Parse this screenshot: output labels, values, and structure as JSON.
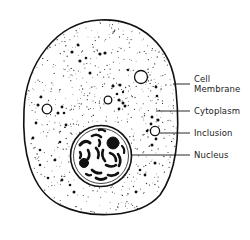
{
  "diagram": {
    "colors": {
      "ink": "#111111",
      "background": "#ffffff",
      "label": "#222222"
    },
    "labels": [
      {
        "id": "cell-membrane",
        "lines": [
          "Cell",
          "Membrane"
        ]
      },
      {
        "id": "cytoplasm",
        "lines": [
          "Cytoplasm"
        ]
      },
      {
        "id": "inclusion",
        "lines": [
          "Inclusion"
        ]
      },
      {
        "id": "nucleus",
        "lines": [
          "Nucleus"
        ]
      }
    ]
  }
}
